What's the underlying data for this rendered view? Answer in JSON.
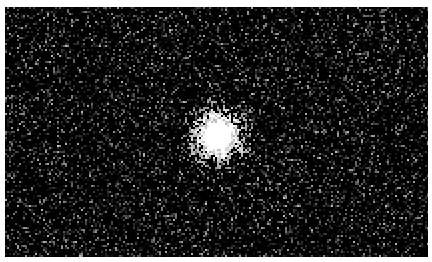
{
  "image": {
    "description": "Noisy grayscale image of a single bright point source",
    "background_color": "#000000",
    "border_color": "#ffffff",
    "field": {
      "x": 5,
      "y": 7,
      "width": 423,
      "height": 250
    },
    "source": {
      "cx": 217,
      "cy": 135,
      "core_radius": 14,
      "halo_radius": 45,
      "color": "#ffffff"
    },
    "noise": {
      "density": 0.35,
      "max_brightness": 200
    }
  }
}
